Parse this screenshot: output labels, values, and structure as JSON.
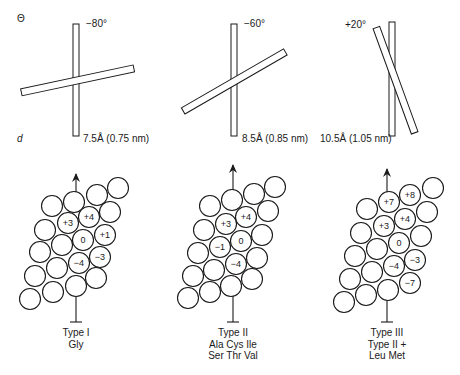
{
  "axis_labels": {
    "theta": "Θ",
    "distance": "d"
  },
  "panels": [
    {
      "angle_label": "−80°",
      "distance_label": "7.5Å (0.75 nm)",
      "type_title": "Type I",
      "residues_line1": "Gly",
      "residues_line2": "",
      "labels": {
        "r1c1": "+4",
        "r1c2": "+3",
        "r2c1": "+1",
        "r2c2": "0",
        "r3c1": "−3",
        "r3c2": "−4"
      }
    },
    {
      "angle_label": "−60°",
      "distance_label": "8.5Å (0.85 nm)",
      "type_title": "Type II",
      "residues_line1": "Ala Cys Ile",
      "residues_line2": "Ser Thr Val",
      "labels": {
        "a": "+4",
        "b": "+3",
        "c": "0",
        "d": "−1",
        "e": "−4"
      }
    },
    {
      "angle_label": "+20°",
      "distance_label": "10.5Å (1.05 nm)",
      "type_title": "Type III",
      "residues_line1": "Type II +",
      "residues_line2": "Leu Met",
      "labels": {
        "a": "+8",
        "b": "+7",
        "c": "+4",
        "d": "+3",
        "e": "0",
        "f": "−3",
        "g": "−4",
        "h": "−7"
      }
    }
  ]
}
